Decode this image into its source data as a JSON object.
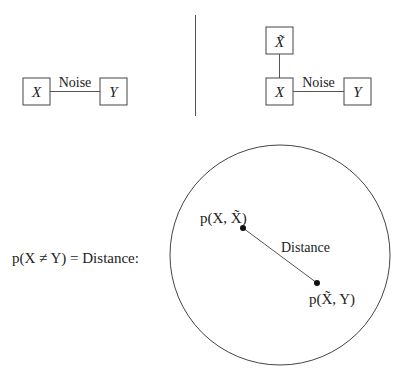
{
  "left_graph": {
    "nodes": [
      {
        "id": "X",
        "label": "X"
      },
      {
        "id": "Y",
        "label": "Y"
      }
    ],
    "edge_label": "Noise"
  },
  "right_graph": {
    "nodes": [
      {
        "id": "Xt",
        "label": "X̃"
      },
      {
        "id": "X",
        "label": "X"
      },
      {
        "id": "Y",
        "label": "Y"
      }
    ],
    "edge_label": "Noise"
  },
  "bottom": {
    "equation": "p(X ≠ Y) = Distance:",
    "point1_label": "p(X, X̃)",
    "point2_label": "p(X̃, Y)",
    "distance_label": "Distance"
  }
}
